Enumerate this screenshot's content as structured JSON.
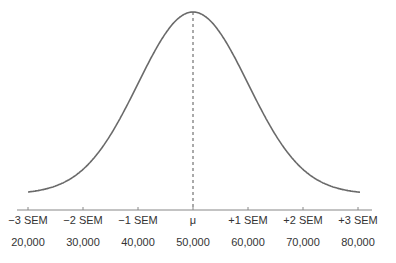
{
  "chart_data": {
    "type": "line",
    "title": "",
    "xlabel": "",
    "ylabel": "",
    "x": [
      20000,
      30000,
      40000,
      50000,
      60000,
      70000,
      80000
    ],
    "sem_labels": [
      "−3 SEM",
      "−2 SEM",
      "−1 SEM",
      "μ",
      "+1 SEM",
      "+2 SEM",
      "+3 SEM"
    ],
    "value_labels": [
      "20,000",
      "30,000",
      "40,000",
      "50,000",
      "60,000",
      "70,000",
      "80,000"
    ],
    "mean": 50000,
    "sem": 10000,
    "xlim": [
      18000,
      82000
    ],
    "grid": false,
    "legend": null,
    "annotations": [
      "dashed vertical line at μ (mean)"
    ],
    "colors": {
      "curve": "#6a6a6a",
      "axis": "#888888",
      "mean_line": "#555555"
    }
  }
}
